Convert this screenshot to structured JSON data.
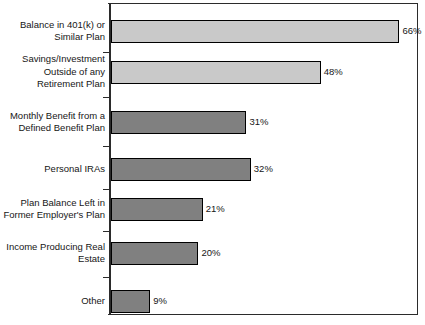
{
  "chart_data": {
    "type": "bar",
    "orientation": "horizontal",
    "title": "",
    "subtitle": "",
    "xlabel": "",
    "ylabel": "",
    "xlim": [
      0,
      70
    ],
    "grid": false,
    "legend": null,
    "value_suffix": "%",
    "categories": [
      "Balance in 401(k) or\nSimilar Plan",
      "Savings/Investment\nOutside of any\nRetirement Plan",
      "Monthly Benefit from a\nDefined Benefit Plan",
      "Personal IRAs",
      "Plan Balance Left in\nFormer Employer's Plan",
      "Income Producing Real\nEstate",
      "Other"
    ],
    "values": [
      66,
      48,
      31,
      32,
      21,
      20,
      9
    ],
    "value_labels": [
      "66%",
      "48%",
      "31%",
      "32%",
      "21%",
      "20%",
      "9%"
    ],
    "bar_colors": [
      "#c9c9c9",
      "#c9c9c9",
      "#808080",
      "#808080",
      "#808080",
      "#808080",
      "#808080"
    ],
    "bar_border_color": "#000000",
    "plot_background": "#ffffff",
    "axis_color": "#2b2b2b"
  }
}
